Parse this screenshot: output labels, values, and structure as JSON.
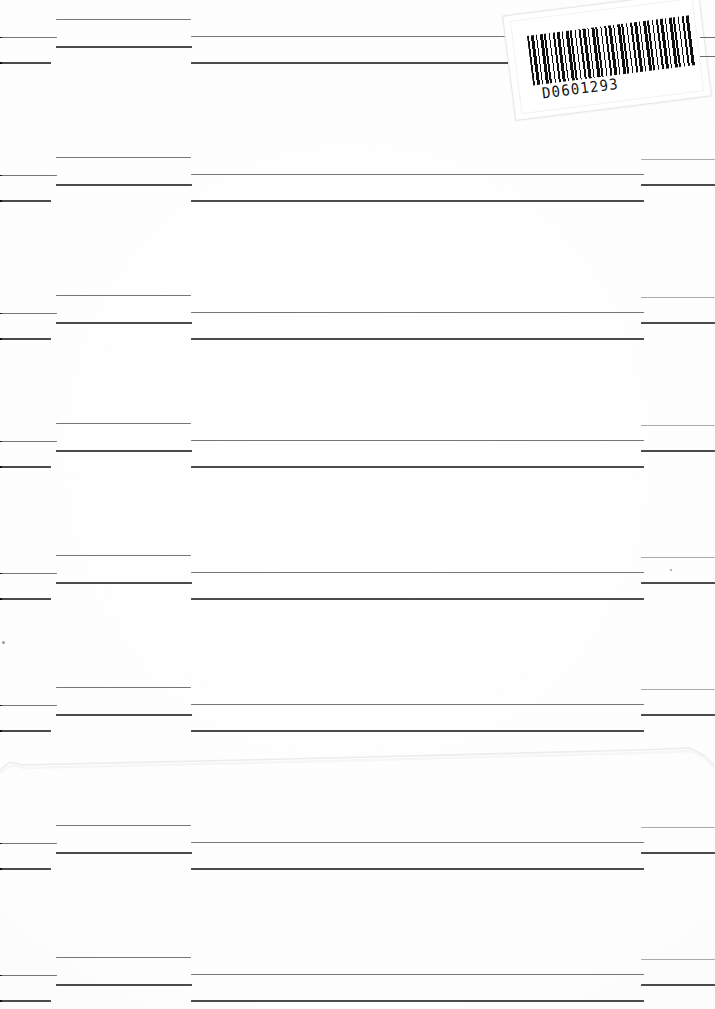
{
  "document": {
    "kind": "scanned-redacted-page",
    "page_width": 715,
    "page_height": 1009,
    "background_color": "#fefefe",
    "rule_color": "#5f5f62"
  },
  "barcode_label": {
    "name": "archive-barcode-sticker",
    "number": "D0601293",
    "rotation_deg": -7.2,
    "background_color": "#ffffff",
    "bar_color": "#101010"
  },
  "artifacts": {
    "fold_label": "paper fold crease",
    "fold_color": "#ececee",
    "speck_color": "#9a9a9f"
  },
  "bands": [
    {
      "name": "band-1",
      "top": 0,
      "rules": [
        {
          "name": "left-stub-upper",
          "x": 0,
          "y": 37,
          "w": 57,
          "h": 1,
          "tone": "mid"
        },
        {
          "name": "left-stub-lower",
          "x": 0,
          "y": 62,
          "w": 51,
          "h": 2,
          "tone": "dark"
        },
        {
          "name": "midleft-upper",
          "x": 56,
          "y": 19,
          "w": 135,
          "h": 1,
          "tone": "mid"
        },
        {
          "name": "midleft-lower",
          "x": 56,
          "y": 46,
          "w": 136,
          "h": 2,
          "tone": "dark"
        },
        {
          "name": "wide-upper",
          "x": 191,
          "y": 36,
          "w": 319,
          "h": 1,
          "tone": "mid"
        },
        {
          "name": "wide-lower",
          "x": 191,
          "y": 62,
          "w": 319,
          "h": 2,
          "tone": "dark"
        }
      ],
      "edge_stubs": [
        {
          "name": "right-edge-stub-upper",
          "x": 700,
          "y": 37,
          "w": 15
        },
        {
          "name": "right-edge-stub-lower",
          "x": 700,
          "y": 56,
          "w": 15
        }
      ]
    },
    {
      "name": "band-2",
      "top": 138,
      "rules": [
        {
          "name": "left-stub-upper",
          "x": 0,
          "y": 37,
          "w": 57,
          "h": 1,
          "tone": "mid"
        },
        {
          "name": "left-stub-lower",
          "x": 0,
          "y": 62,
          "w": 51,
          "h": 2,
          "tone": "dark"
        },
        {
          "name": "midleft-upper",
          "x": 56,
          "y": 19,
          "w": 135,
          "h": 1,
          "tone": "mid"
        },
        {
          "name": "midleft-lower",
          "x": 56,
          "y": 46,
          "w": 136,
          "h": 2,
          "tone": "dark"
        },
        {
          "name": "wide-upper",
          "x": 191,
          "y": 36,
          "w": 453,
          "h": 1,
          "tone": "mid"
        },
        {
          "name": "wide-lower",
          "x": 191,
          "y": 62,
          "w": 453,
          "h": 2,
          "tone": "dark"
        },
        {
          "name": "right-col-upper",
          "x": 641,
          "y": 21,
          "w": 74,
          "h": 1,
          "tone": "faint"
        },
        {
          "name": "right-col-lower",
          "x": 641,
          "y": 46,
          "w": 74,
          "h": 2,
          "tone": "dark"
        }
      ],
      "edge_stubs": []
    },
    {
      "name": "band-3",
      "top": 276,
      "rules": [
        {
          "name": "left-stub-upper",
          "x": 0,
          "y": 37,
          "w": 57,
          "h": 1,
          "tone": "mid"
        },
        {
          "name": "left-stub-lower",
          "x": 0,
          "y": 62,
          "w": 51,
          "h": 2,
          "tone": "dark"
        },
        {
          "name": "midleft-upper",
          "x": 56,
          "y": 19,
          "w": 135,
          "h": 1,
          "tone": "mid"
        },
        {
          "name": "midleft-lower",
          "x": 56,
          "y": 46,
          "w": 136,
          "h": 2,
          "tone": "dark"
        },
        {
          "name": "wide-upper",
          "x": 191,
          "y": 36,
          "w": 453,
          "h": 1,
          "tone": "mid"
        },
        {
          "name": "wide-lower",
          "x": 191,
          "y": 62,
          "w": 453,
          "h": 2,
          "tone": "dark"
        },
        {
          "name": "right-col-upper",
          "x": 641,
          "y": 21,
          "w": 74,
          "h": 1,
          "tone": "faint"
        },
        {
          "name": "right-col-lower",
          "x": 641,
          "y": 46,
          "w": 74,
          "h": 2,
          "tone": "dark"
        }
      ],
      "edge_stubs": []
    },
    {
      "name": "band-4",
      "top": 404,
      "rules": [
        {
          "name": "left-stub-upper",
          "x": 0,
          "y": 37,
          "w": 57,
          "h": 1,
          "tone": "mid"
        },
        {
          "name": "left-stub-lower",
          "x": 0,
          "y": 62,
          "w": 51,
          "h": 2,
          "tone": "dark"
        },
        {
          "name": "midleft-upper",
          "x": 56,
          "y": 19,
          "w": 135,
          "h": 1,
          "tone": "mid"
        },
        {
          "name": "midleft-lower",
          "x": 56,
          "y": 46,
          "w": 136,
          "h": 2,
          "tone": "dark"
        },
        {
          "name": "wide-upper",
          "x": 191,
          "y": 36,
          "w": 453,
          "h": 1,
          "tone": "mid"
        },
        {
          "name": "wide-lower",
          "x": 191,
          "y": 62,
          "w": 453,
          "h": 2,
          "tone": "dark"
        },
        {
          "name": "right-col-upper",
          "x": 641,
          "y": 21,
          "w": 74,
          "h": 1,
          "tone": "faint"
        },
        {
          "name": "right-col-lower",
          "x": 641,
          "y": 46,
          "w": 74,
          "h": 2,
          "tone": "dark"
        }
      ],
      "edge_stubs": []
    },
    {
      "name": "band-5",
      "top": 536,
      "rules": [
        {
          "name": "left-stub-upper",
          "x": 0,
          "y": 37,
          "w": 57,
          "h": 1,
          "tone": "mid"
        },
        {
          "name": "left-stub-lower",
          "x": 0,
          "y": 62,
          "w": 51,
          "h": 2,
          "tone": "dark"
        },
        {
          "name": "midleft-upper",
          "x": 56,
          "y": 19,
          "w": 135,
          "h": 1,
          "tone": "mid"
        },
        {
          "name": "midleft-lower",
          "x": 56,
          "y": 46,
          "w": 136,
          "h": 2,
          "tone": "dark"
        },
        {
          "name": "wide-upper",
          "x": 191,
          "y": 36,
          "w": 453,
          "h": 1,
          "tone": "mid"
        },
        {
          "name": "wide-lower",
          "x": 191,
          "y": 62,
          "w": 453,
          "h": 2,
          "tone": "dark"
        },
        {
          "name": "right-col-upper",
          "x": 641,
          "y": 21,
          "w": 74,
          "h": 1,
          "tone": "faint"
        },
        {
          "name": "right-col-lower",
          "x": 641,
          "y": 46,
          "w": 74,
          "h": 2,
          "tone": "dark"
        }
      ],
      "edge_stubs": []
    },
    {
      "name": "band-6",
      "top": 668,
      "rules": [
        {
          "name": "left-stub-upper",
          "x": 0,
          "y": 37,
          "w": 57,
          "h": 1,
          "tone": "mid"
        },
        {
          "name": "left-stub-lower",
          "x": 0,
          "y": 62,
          "w": 51,
          "h": 2,
          "tone": "dark"
        },
        {
          "name": "midleft-upper",
          "x": 56,
          "y": 19,
          "w": 135,
          "h": 1,
          "tone": "mid"
        },
        {
          "name": "midleft-lower",
          "x": 56,
          "y": 46,
          "w": 136,
          "h": 2,
          "tone": "dark"
        },
        {
          "name": "wide-upper",
          "x": 191,
          "y": 36,
          "w": 453,
          "h": 1,
          "tone": "mid"
        },
        {
          "name": "wide-lower",
          "x": 191,
          "y": 62,
          "w": 453,
          "h": 2,
          "tone": "dark"
        },
        {
          "name": "right-col-upper",
          "x": 641,
          "y": 21,
          "w": 74,
          "h": 1,
          "tone": "faint"
        },
        {
          "name": "right-col-lower",
          "x": 641,
          "y": 46,
          "w": 74,
          "h": 2,
          "tone": "dark"
        }
      ],
      "edge_stubs": []
    },
    {
      "name": "band-7",
      "top": 806,
      "rules": [
        {
          "name": "left-stub-upper",
          "x": 0,
          "y": 37,
          "w": 57,
          "h": 1,
          "tone": "mid"
        },
        {
          "name": "left-stub-lower",
          "x": 0,
          "y": 62,
          "w": 51,
          "h": 2,
          "tone": "dark"
        },
        {
          "name": "midleft-upper",
          "x": 56,
          "y": 19,
          "w": 135,
          "h": 1,
          "tone": "mid"
        },
        {
          "name": "midleft-lower",
          "x": 56,
          "y": 46,
          "w": 136,
          "h": 2,
          "tone": "dark"
        },
        {
          "name": "wide-upper",
          "x": 191,
          "y": 36,
          "w": 453,
          "h": 1,
          "tone": "mid"
        },
        {
          "name": "wide-lower",
          "x": 191,
          "y": 62,
          "w": 453,
          "h": 2,
          "tone": "dark"
        },
        {
          "name": "right-col-upper",
          "x": 641,
          "y": 21,
          "w": 74,
          "h": 1,
          "tone": "faint"
        },
        {
          "name": "right-col-lower",
          "x": 641,
          "y": 46,
          "w": 74,
          "h": 2,
          "tone": "dark"
        }
      ],
      "edge_stubs": []
    },
    {
      "name": "band-8",
      "top": 938,
      "rules": [
        {
          "name": "left-stub-upper",
          "x": 0,
          "y": 37,
          "w": 57,
          "h": 1,
          "tone": "mid"
        },
        {
          "name": "left-stub-lower",
          "x": 0,
          "y": 62,
          "w": 51,
          "h": 2,
          "tone": "dark"
        },
        {
          "name": "midleft-upper",
          "x": 56,
          "y": 19,
          "w": 135,
          "h": 1,
          "tone": "mid"
        },
        {
          "name": "midleft-lower",
          "x": 56,
          "y": 46,
          "w": 136,
          "h": 2,
          "tone": "dark"
        },
        {
          "name": "wide-upper",
          "x": 191,
          "y": 36,
          "w": 453,
          "h": 1,
          "tone": "mid"
        },
        {
          "name": "wide-lower",
          "x": 191,
          "y": 62,
          "w": 453,
          "h": 2,
          "tone": "dark"
        },
        {
          "name": "right-col-upper",
          "x": 641,
          "y": 21,
          "w": 74,
          "h": 1,
          "tone": "faint"
        },
        {
          "name": "right-col-lower",
          "x": 641,
          "y": 46,
          "w": 74,
          "h": 2,
          "tone": "dark"
        }
      ],
      "edge_stubs": []
    }
  ],
  "specks": [
    {
      "name": "speck-left-margin",
      "x": 2,
      "y": 641,
      "d": 3
    },
    {
      "name": "speck-right-col",
      "x": 670,
      "y": 569,
      "d": 2
    }
  ]
}
